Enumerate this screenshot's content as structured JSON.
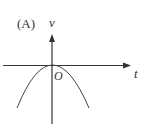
{
  "diagram": {
    "option_label": "(A)",
    "y_axis_label": "v",
    "x_axis_label": "t",
    "origin_label": "O",
    "curve": "downward parabola with vertex at origin",
    "colors": {
      "stroke": "#333333",
      "background": "#ffffff"
    }
  }
}
